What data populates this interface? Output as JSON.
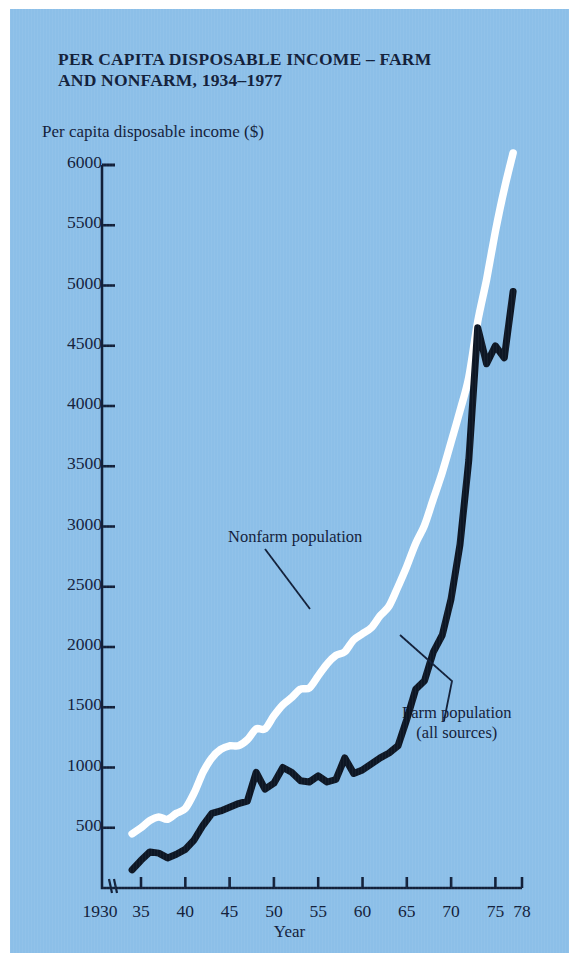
{
  "figure": {
    "title": "PER CAPITA DISPOSABLE INCOME – FARM AND NONFARM, 1934–1977",
    "title_line1": "PER CAPITA DISPOSABLE INCOME – FARM",
    "title_line2": "AND NONFARM, 1934–1977",
    "background_color": "#8cbfe8",
    "ink_color": "#12203a",
    "nonfarm_color": "#ffffff",
    "farm_color": "#0d1624"
  },
  "annotations": {
    "nonfarm": "Nonfarm population",
    "farm_line1": "Farm population",
    "farm_line2": "(all sources)"
  },
  "chart_data": {
    "type": "line",
    "title": "PER CAPITA DISPOSABLE INCOME – FARM AND NONFARM, 1934–1977",
    "xlabel": "Year",
    "ylabel": "Per capita disposable income ($)",
    "xlim": [
      1930,
      1978
    ],
    "ylim": [
      0,
      6000
    ],
    "x_axis_break_after": 1930,
    "grid": false,
    "legend": "inline-annotations",
    "ytick_labels": [
      "6000",
      "5500",
      "5000",
      "4500",
      "4000",
      "3500",
      "3000",
      "2500",
      "2000",
      "1500",
      "1000",
      "500"
    ],
    "ytick_values": [
      6000,
      5500,
      5000,
      4500,
      4000,
      3500,
      3000,
      2500,
      2000,
      1500,
      1000,
      500
    ],
    "xtick_labels": [
      "1930",
      "35",
      "40",
      "45",
      "50",
      "55",
      "60",
      "65",
      "70",
      "75",
      "78"
    ],
    "xtick_values": [
      1930,
      1935,
      1940,
      1945,
      1950,
      1955,
      1960,
      1965,
      1970,
      1975,
      1978
    ],
    "series": [
      {
        "name": "Nonfarm population",
        "color": "#ffffff",
        "x": [
          1934,
          1935,
          1936,
          1937,
          1938,
          1939,
          1940,
          1941,
          1942,
          1943,
          1944,
          1945,
          1946,
          1947,
          1948,
          1949,
          1950,
          1951,
          1952,
          1953,
          1954,
          1955,
          1956,
          1957,
          1958,
          1959,
          1960,
          1961,
          1962,
          1963,
          1964,
          1965,
          1966,
          1967,
          1968,
          1969,
          1970,
          1971,
          1972,
          1973,
          1974,
          1975,
          1976,
          1977
        ],
        "values": [
          450,
          500,
          560,
          590,
          570,
          620,
          660,
          790,
          960,
          1080,
          1150,
          1180,
          1180,
          1230,
          1320,
          1320,
          1430,
          1520,
          1580,
          1650,
          1660,
          1760,
          1860,
          1930,
          1960,
          2060,
          2110,
          2160,
          2260,
          2340,
          2500,
          2670,
          2860,
          3010,
          3230,
          3450,
          3700,
          3960,
          4240,
          4700,
          5050,
          5450,
          5800,
          6100
        ]
      },
      {
        "name": "Farm population (all sources)",
        "color": "#0d1624",
        "x": [
          1934,
          1935,
          1936,
          1937,
          1938,
          1939,
          1940,
          1941,
          1942,
          1943,
          1944,
          1945,
          1946,
          1947,
          1948,
          1949,
          1950,
          1951,
          1952,
          1953,
          1954,
          1955,
          1956,
          1957,
          1958,
          1959,
          1960,
          1961,
          1962,
          1963,
          1964,
          1965,
          1966,
          1967,
          1968,
          1969,
          1970,
          1971,
          1972,
          1973,
          1974,
          1975,
          1976,
          1977
        ],
        "values": [
          150,
          230,
          300,
          290,
          250,
          280,
          320,
          400,
          520,
          620,
          640,
          670,
          700,
          720,
          960,
          820,
          870,
          1000,
          960,
          890,
          880,
          930,
          880,
          900,
          1080,
          950,
          980,
          1030,
          1080,
          1120,
          1180,
          1400,
          1650,
          1720,
          1960,
          2100,
          2400,
          2850,
          3550,
          4650,
          4350,
          4500,
          4400,
          4950
        ]
      }
    ]
  }
}
